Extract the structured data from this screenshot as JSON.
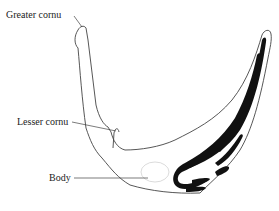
{
  "diagram": {
    "labels": [
      {
        "id": "greater-cornu",
        "text": "Greater cornu"
      },
      {
        "id": "lesser-cornu",
        "text": "Lesser cornu"
      },
      {
        "id": "body",
        "text": "Body"
      }
    ],
    "colors": {
      "outline": "#444444",
      "fill_dark": "#111111",
      "background": "#ffffff"
    }
  }
}
